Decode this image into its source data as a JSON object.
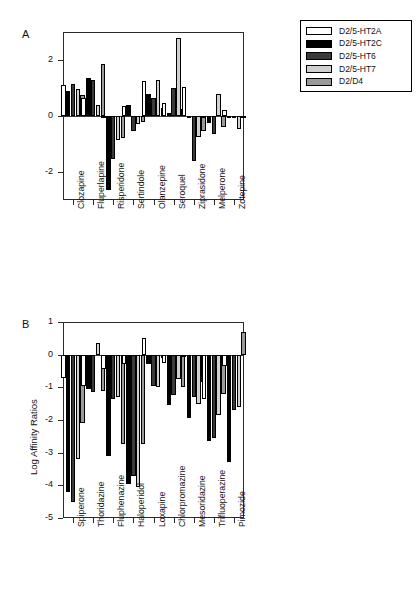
{
  "legend": {
    "items": [
      {
        "label": "D2/5-HT2A",
        "color": "#ffffff",
        "name": "series-d2-5ht2a"
      },
      {
        "label": "D2/5-HT2C",
        "color": "#000000",
        "name": "series-d2-5ht2c"
      },
      {
        "label": "D2/5-HT6",
        "color": "#3a3a3a",
        "name": "series-d2-5ht6"
      },
      {
        "label": "D2/5-HT7",
        "color": "#d0d0d0",
        "name": "series-d2-5ht7"
      },
      {
        "label": "D2/D4",
        "color": "#9a9a9a",
        "name": "series-d2-d4"
      }
    ]
  },
  "panels": {
    "a": {
      "letter": "A"
    },
    "b": {
      "letter": "B"
    }
  },
  "chart_data": [
    {
      "type": "bar",
      "panel": "A",
      "title": "",
      "xlabel": "",
      "ylabel": "",
      "ylim": [
        -3.0,
        3.0
      ],
      "yticks": [
        -2,
        0,
        2
      ],
      "ytick_labels": [
        "-2",
        "0",
        "2"
      ],
      "grid": false,
      "legend_position": "outside-top-right",
      "categories": [
        "Clozapine",
        "Fluperlapine",
        "Risperidone",
        "Sertindole",
        "Olanzepine",
        "Seroquel",
        "Ziprasidone",
        "Melperone",
        "Zotepine"
      ],
      "series": [
        {
          "name": "D2/5-HT2A",
          "color": "#ffffff",
          "values": [
            1.1,
            0.65,
            -0.05,
            0.35,
            1.25,
            0.45,
            1.05,
            0.0,
            0.2
          ]
        },
        {
          "name": "D2/5-HT2C",
          "color": "#000000",
          "values": [
            0.9,
            1.35,
            -2.65,
            0.4,
            0.8,
            0.1,
            -0.02,
            -0.25,
            0.0
          ]
        },
        {
          "name": "D2/5-HT6",
          "color": "#3a3a3a",
          "values": [
            1.15,
            1.3,
            -1.55,
            -0.55,
            0.65,
            1.0,
            -1.6,
            -0.65,
            -0.05
          ]
        },
        {
          "name": "D2/5-HT7",
          "color": "#d0d0d0",
          "values": [
            0.95,
            0.4,
            -0.85,
            -0.3,
            1.3,
            2.8,
            -0.75,
            0.8,
            -0.45
          ]
        },
        {
          "name": "D2/D4",
          "color": "#9a9a9a",
          "values": [
            0.75,
            1.85,
            -0.8,
            -0.2,
            0.3,
            0.25,
            -0.55,
            -0.4,
            0.0
          ]
        }
      ]
    },
    {
      "type": "bar",
      "panel": "B",
      "title": "",
      "xlabel": "",
      "ylabel": "Log Affinity Ratios",
      "ylim": [
        -5.0,
        1.0
      ],
      "yticks": [
        1,
        0,
        -1,
        -2,
        -3,
        -4,
        -5
      ],
      "ytick_labels": [
        "1",
        "0",
        "-1",
        "-2",
        "-3",
        "-4",
        "-5"
      ],
      "grid": false,
      "legend_position": "none",
      "categories": [
        "Spiperone",
        "Thoridazine",
        "Fluphenazine",
        "Haloperidol",
        "Loxapine",
        "Chlorpromazine",
        "Mesoridazine",
        "Trifluoperazine",
        "Pimozide"
      ],
      "series": [
        {
          "name": "D2/5-HT2A",
          "color": "#ffffff",
          "values": [
            -0.7,
            -0.95,
            -0.45,
            -0.3,
            0.5,
            -0.25,
            0.0,
            -1.35,
            -0.35
          ]
        },
        {
          "name": "D2/5-HT2C",
          "color": "#000000",
          "values": [
            -4.2,
            -1.05,
            -3.1,
            -3.95,
            -0.3,
            -1.55,
            -1.95,
            -2.65,
            -3.3
          ]
        },
        {
          "name": "D2/5-HT6",
          "color": "#3a3a3a",
          "values": [
            -4.5,
            -1.15,
            -1.35,
            -3.7,
            -0.95,
            -1.25,
            -1.3,
            -2.55,
            -1.7
          ]
        },
        {
          "name": "D2/5-HT7",
          "color": "#d0d0d0",
          "values": [
            -3.2,
            0.35,
            -1.3,
            -4.05,
            -1.0,
            -0.75,
            -1.5,
            -1.85,
            -1.6
          ]
        },
        {
          "name": "D2/D4",
          "color": "#9a9a9a",
          "values": [
            -2.1,
            -1.1,
            -2.75,
            -2.75,
            -0.1,
            -1.0,
            -0.85,
            -1.2,
            0.7
          ]
        }
      ]
    }
  ]
}
